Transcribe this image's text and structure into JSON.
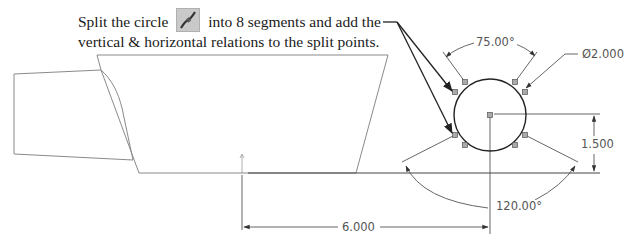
{
  "callout": {
    "line1_before": "Split the circle",
    "line1_after": "into 8 segments and add the",
    "line2": "vertical & horizontal relations to the split points.",
    "icon": "split-entities-icon"
  },
  "dimensions": {
    "top_angle": "75.00°",
    "diameter": "Ø2.000",
    "vertical": "1.500",
    "bottom_angle": "120.00°",
    "horizontal": "6.000"
  },
  "colors": {
    "geometry": "#8a8a8a",
    "circle": "#222222",
    "dimension": "#555555",
    "leader": "#222222"
  }
}
